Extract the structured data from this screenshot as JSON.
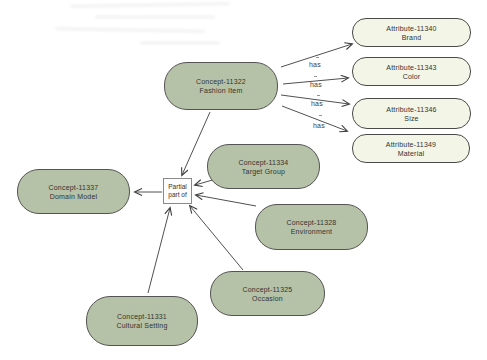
{
  "diagram": {
    "colors": {
      "concept_fill": "#b6c2a7",
      "attribute_fill": "#f3f5e6",
      "node_border": "#545454",
      "edge_color": "#3c3c3c"
    },
    "nodes": {
      "fashion_item": {
        "code": "Concept-11322",
        "name": "Fashion Item"
      },
      "target_group": {
        "code": "Concept-11334",
        "name": "Target Group"
      },
      "domain_model": {
        "code": "Concept-11337",
        "name": "Domain Model"
      },
      "environment": {
        "code": "Concept-11328",
        "name": "Environment"
      },
      "occasion": {
        "code": "Concept-11325",
        "name": "Occasion"
      },
      "cultural_setting": {
        "code": "Concept-11331",
        "name": "Cultural Setting"
      },
      "brand": {
        "code": "Attribute-11340",
        "name": "Brand"
      },
      "color": {
        "code": "Attribute-11343",
        "name": "Color"
      },
      "size": {
        "code": "Attribute-11346",
        "name": "Size"
      },
      "material": {
        "code": "Attribute-11349",
        "name": "Material"
      }
    },
    "relation_box": {
      "line1": "Partial",
      "line2": "part of"
    },
    "edge_labels": {
      "has_1": "has",
      "has_2": "has",
      "has_3": "has",
      "has_4": "has"
    }
  }
}
